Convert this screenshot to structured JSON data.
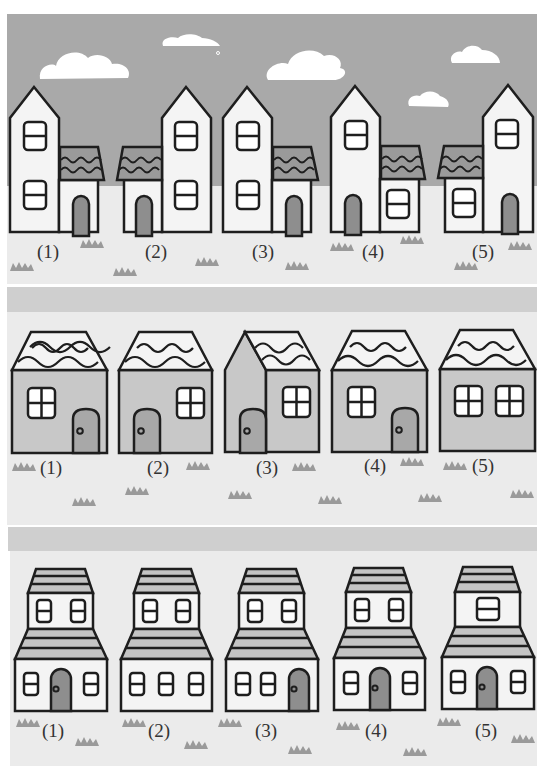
{
  "colors": {
    "page_bg": "#ffffff",
    "sky": "#a9a9a9",
    "ground": "#ebebeb",
    "road": "#cfcfcf",
    "wall_light": "#f4f4f4",
    "wall_mid": "#c8c8c8",
    "roof_dark": "#9a9a9a",
    "roof_band": "#c4c4c4",
    "door": "#8e8e8e",
    "door_mid": "#a8a8a8",
    "grass": "#9a9a9a",
    "outline": "#1e1e1e",
    "cloud": "#ffffff"
  },
  "sections": [
    {
      "name": "row-1-tall-houses",
      "labels": [
        "(1)",
        "(2)",
        "(3)",
        "(4)",
        "(5)"
      ]
    },
    {
      "name": "row-2-cottages",
      "labels": [
        "(1)",
        "(2)",
        "(3)",
        "(4)",
        "(5)"
      ]
    },
    {
      "name": "row-3-two-story-houses",
      "labels": [
        "(1)",
        "(2)",
        "(3)",
        "(4)",
        "(5)"
      ]
    }
  ]
}
